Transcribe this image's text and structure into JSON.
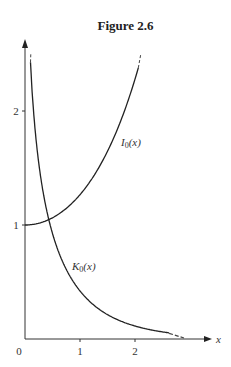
{
  "figure": {
    "title": "Figure 2.6"
  },
  "chart_data": {
    "type": "line",
    "title": "Figure 2.6",
    "xlabel": "x",
    "ylabel": "",
    "xlim": [
      0,
      2.8
    ],
    "ylim": [
      0,
      2.5
    ],
    "x_ticks": [
      "0",
      "1",
      "2"
    ],
    "y_ticks": [
      "1",
      "2"
    ],
    "grid": false,
    "legend": "inline curve labels",
    "series": [
      {
        "name": "I0(x)",
        "label_main": "I",
        "label_sub": "0",
        "label_arg": "(x)",
        "x": [
          0,
          0.25,
          0.5,
          0.75,
          1.0,
          1.25,
          1.5,
          1.75,
          2.0,
          2.07
        ],
        "values": [
          1.0,
          1.016,
          1.064,
          1.146,
          1.266,
          1.43,
          1.647,
          1.925,
          2.28,
          2.38
        ]
      },
      {
        "name": "K0(x)",
        "label_main": "K",
        "label_sub": "0",
        "label_arg": "(x)",
        "x": [
          0.1,
          0.15,
          0.2,
          0.3,
          0.4,
          0.5,
          0.75,
          1.0,
          1.25,
          1.5,
          2.0,
          2.5,
          2.75
        ],
        "values": [
          2.427,
          2.03,
          1.753,
          1.372,
          1.115,
          0.924,
          0.611,
          0.421,
          0.298,
          0.214,
          0.114,
          0.062,
          0.046
        ]
      }
    ]
  }
}
